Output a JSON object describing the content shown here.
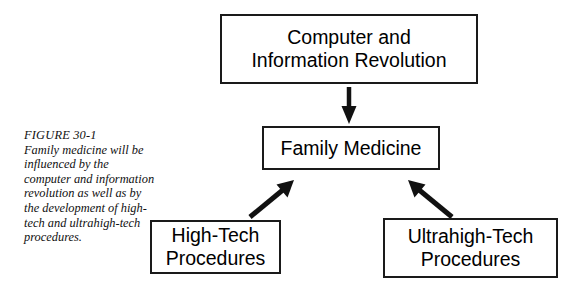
{
  "figure": {
    "caption_label": "FIGURE 30-1",
    "caption_text": "Family medicine will be influenced by the computer and information revolution as well as by the development of high-tech and ultrahigh-tech procedures.",
    "stroke_color": "#1a1a1a",
    "background_color": "#ffffff"
  },
  "nodes": {
    "top": {
      "label": "Computer and\nInformation Revolution"
    },
    "center": {
      "label": "Family Medicine"
    },
    "left": {
      "label": "High-Tech\nProcedures"
    },
    "right": {
      "label": "Ultrahigh-Tech\nProcedures"
    }
  },
  "arrows": [
    {
      "name": "top-to-center",
      "from": "top",
      "to": "center",
      "direction": "down"
    },
    {
      "name": "left-to-center",
      "from": "left",
      "to": "center",
      "direction": "up-right"
    },
    {
      "name": "right-to-center",
      "from": "right",
      "to": "center",
      "direction": "up-left"
    }
  ]
}
